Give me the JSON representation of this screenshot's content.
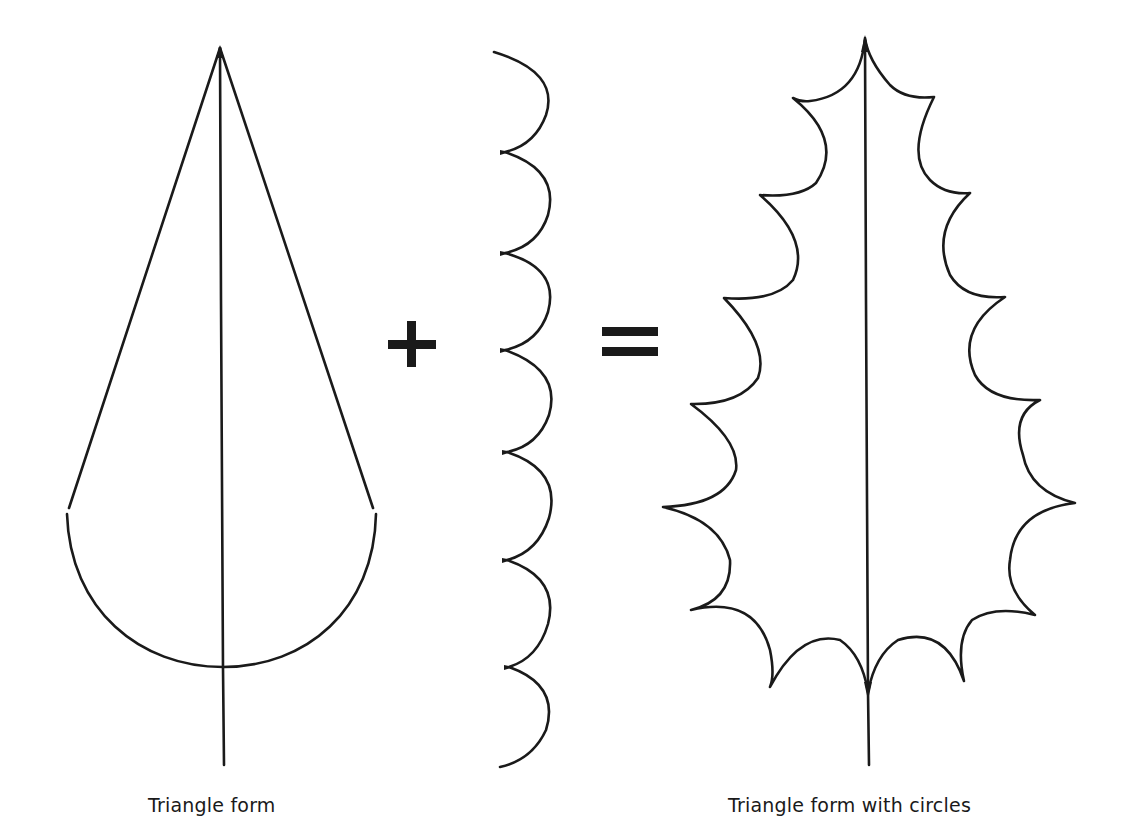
{
  "figure": {
    "background_color": "#ffffff",
    "ink_color": "#1a1a1a",
    "captions": {
      "left": "Triangle form",
      "right": "Triangle form with circles"
    },
    "operators": {
      "plus": "+",
      "equals": "="
    },
    "elements": [
      {
        "id": "triangle-form",
        "label": "Triangle form",
        "parts": [
          "apex",
          "two sides",
          "rounded base arc",
          "midrib with stem"
        ]
      },
      {
        "id": "scallop-column",
        "label": "Column of circular arcs",
        "arc_count": 7
      },
      {
        "id": "holly-leaf",
        "label": "Triangle form with circles",
        "left_lobes": 8,
        "right_lobes": 8,
        "spine_points": 15
      }
    ]
  }
}
